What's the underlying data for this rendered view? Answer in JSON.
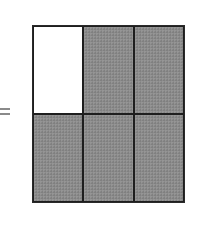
{
  "diagram": {
    "symbol": "=",
    "grid": {
      "rows": 2,
      "columns": 3,
      "cells": [
        {
          "row": 1,
          "col": 1,
          "shaded": false
        },
        {
          "row": 1,
          "col": 2,
          "shaded": true
        },
        {
          "row": 1,
          "col": 3,
          "shaded": true
        },
        {
          "row": 2,
          "col": 1,
          "shaded": true
        },
        {
          "row": 2,
          "col": 2,
          "shaded": true
        },
        {
          "row": 2,
          "col": 3,
          "shaded": true
        }
      ],
      "shaded_count": 5,
      "total_count": 6
    },
    "colors": {
      "shade": "#8c8c8c",
      "border": "#1e1e1e",
      "background": "#ffffff"
    }
  }
}
